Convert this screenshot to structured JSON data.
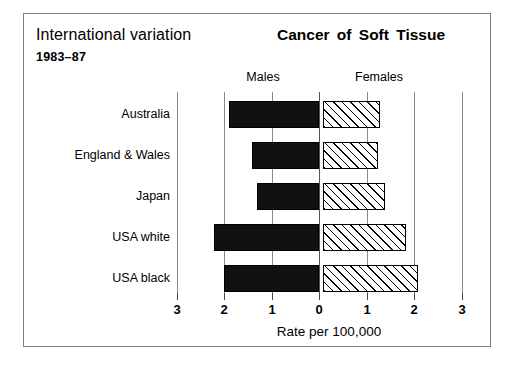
{
  "header": {
    "title_left": "International variation",
    "years": "1983–87",
    "title_right": "Cancer  of  Soft Tissue",
    "males_label": "Males",
    "females_label": "Females"
  },
  "axis": {
    "xlabel": "Rate per 100,000",
    "ticks_left": [
      "3",
      "2",
      "1",
      "0"
    ],
    "ticks_right": [
      "1",
      "2",
      "3"
    ]
  },
  "chart_data": {
    "type": "bar",
    "orientation": "horizontal-bidirectional",
    "title": "Cancer of Soft Tissue",
    "subtitle": "International variation 1983–87",
    "xlabel": "Rate per 100,000",
    "ylabel": "",
    "xlim": [
      -3,
      3
    ],
    "xticks": [
      -3,
      -2,
      -1,
      0,
      1,
      2,
      3
    ],
    "xticklabels": [
      "3",
      "2",
      "1",
      "0",
      "1",
      "2",
      "3"
    ],
    "grid": true,
    "legend": [
      "Males",
      "Females"
    ],
    "legend_position": "top",
    "categories": [
      "Australia",
      "England & Wales",
      "Japan",
      "USA white",
      "USA black"
    ],
    "series": [
      {
        "name": "Males",
        "direction": "left",
        "values": [
          1.9,
          1.4,
          1.3,
          2.2,
          2.0
        ]
      },
      {
        "name": "Females",
        "direction": "right",
        "values": [
          1.2,
          1.15,
          1.3,
          1.75,
          2.0
        ]
      }
    ]
  },
  "rows": [
    {
      "label": "Australia",
      "male": 1.9,
      "female": 1.2
    },
    {
      "label": "England & Wales",
      "male": 1.4,
      "female": 1.15
    },
    {
      "label": "Japan",
      "male": 1.3,
      "female": 1.3
    },
    {
      "label": "USA white",
      "male": 2.2,
      "female": 1.75
    },
    {
      "label": "USA black",
      "male": 2.0,
      "female": 2.0
    }
  ]
}
